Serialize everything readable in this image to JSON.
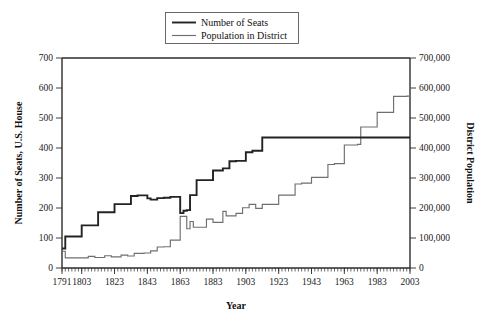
{
  "chart_data": {
    "type": "line",
    "title": "",
    "xlabel": "Year",
    "ylabel": "Number of Seats, U.S. House",
    "y2label": "District Population",
    "xlim": [
      1791,
      2003
    ],
    "ylim": [
      0,
      700
    ],
    "y2lim": [
      0,
      700000
    ],
    "grid": false,
    "legend_position": "top-center",
    "x_tick_labels": [
      "1791",
      "1803",
      "1823",
      "1843",
      "1863",
      "1883",
      "1903",
      "1923",
      "1943",
      "1963",
      "1983",
      "2003"
    ],
    "x_tick_values": [
      1791,
      1803,
      1823,
      1843,
      1863,
      1883,
      1903,
      1923,
      1943,
      1963,
      1983,
      2003
    ],
    "x_minor_tick_step": 2,
    "y_tick_labels": [
      "0",
      "100",
      "200",
      "300",
      "400",
      "500",
      "600",
      "700"
    ],
    "y_tick_values": [
      0,
      100,
      200,
      300,
      400,
      500,
      600,
      700
    ],
    "y2_tick_labels": [
      "0",
      "100,000",
      "200,000",
      "300,000",
      "400,000",
      "500,000",
      "600,000",
      "700,000"
    ],
    "y2_tick_values": [
      0,
      100000,
      200000,
      300000,
      400000,
      500000,
      600000,
      700000
    ],
    "series": [
      {
        "name": "Number of Seats",
        "axis": "left",
        "color": "#232323",
        "step": true,
        "x": [
          1791,
          1793,
          1803,
          1813,
          1823,
          1833,
          1843,
          1853,
          1863,
          1873,
          1883,
          1893,
          1903,
          1913,
          1923,
          1933,
          1943,
          1953,
          1963,
          1973,
          1983,
          1993,
          2003
        ],
        "values": [
          65,
          105,
          142,
          186,
          213,
          242,
          232,
          237,
          183,
          243,
          293,
          332,
          357,
          435,
          435,
          435,
          435,
          435,
          435,
          435,
          435,
          435,
          435
        ]
      },
      {
        "name": "Population in District",
        "axis": "right",
        "color": "#6f6f6f",
        "step": true,
        "x": [
          1791,
          1793,
          1803,
          1813,
          1823,
          1833,
          1843,
          1853,
          1863,
          1873,
          1883,
          1893,
          1903,
          1913,
          1923,
          1933,
          1943,
          1953,
          1963,
          1973,
          1983,
          1993,
          2003
        ],
        "values": [
          56000,
          34000,
          34000,
          35000,
          40000,
          48000,
          71000,
          93000,
          127000,
          131000,
          152000,
          174000,
          194000,
          212000,
          212000,
          280000,
          302000,
          345000,
          410000,
          470000,
          519000,
          572000,
          647000
        ]
      }
    ],
    "seats_detail": {
      "label": "Number of Seats",
      "points": [
        {
          "year": 1791,
          "value": 65
        },
        {
          "year": 1793,
          "value": 105
        },
        {
          "year": 1795,
          "value": 105
        },
        {
          "year": 1803,
          "value": 142
        },
        {
          "year": 1813,
          "value": 186
        },
        {
          "year": 1815,
          "value": 186
        },
        {
          "year": 1823,
          "value": 213
        },
        {
          "year": 1833,
          "value": 240
        },
        {
          "year": 1837,
          "value": 242
        },
        {
          "year": 1843,
          "value": 232
        },
        {
          "year": 1845,
          "value": 228
        },
        {
          "year": 1849,
          "value": 233
        },
        {
          "year": 1853,
          "value": 234
        },
        {
          "year": 1857,
          "value": 237
        },
        {
          "year": 1861,
          "value": 237
        },
        {
          "year": 1863,
          "value": 183
        },
        {
          "year": 1865,
          "value": 191
        },
        {
          "year": 1867,
          "value": 193
        },
        {
          "year": 1869,
          "value": 243
        },
        {
          "year": 1873,
          "value": 293
        },
        {
          "year": 1877,
          "value": 293
        },
        {
          "year": 1883,
          "value": 325
        },
        {
          "year": 1889,
          "value": 332
        },
        {
          "year": 1893,
          "value": 356
        },
        {
          "year": 1897,
          "value": 357
        },
        {
          "year": 1903,
          "value": 386
        },
        {
          "year": 1907,
          "value": 391
        },
        {
          "year": 1913,
          "value": 435
        },
        {
          "year": 2003,
          "value": 435
        }
      ]
    },
    "population_detail": {
      "label": "Population in District",
      "points": [
        {
          "year": 1791,
          "value": 56000
        },
        {
          "year": 1793,
          "value": 34000
        },
        {
          "year": 1803,
          "value": 34000
        },
        {
          "year": 1807,
          "value": 39000
        },
        {
          "year": 1811,
          "value": 35000
        },
        {
          "year": 1817,
          "value": 41000
        },
        {
          "year": 1821,
          "value": 37000
        },
        {
          "year": 1827,
          "value": 43000
        },
        {
          "year": 1831,
          "value": 40000
        },
        {
          "year": 1835,
          "value": 49000
        },
        {
          "year": 1841,
          "value": 50000
        },
        {
          "year": 1845,
          "value": 57000
        },
        {
          "year": 1849,
          "value": 70000
        },
        {
          "year": 1853,
          "value": 71000
        },
        {
          "year": 1857,
          "value": 93000
        },
        {
          "year": 1861,
          "value": 93000
        },
        {
          "year": 1863,
          "value": 172000
        },
        {
          "year": 1867,
          "value": 131000
        },
        {
          "year": 1869,
          "value": 155000
        },
        {
          "year": 1871,
          "value": 136000
        },
        {
          "year": 1877,
          "value": 136000
        },
        {
          "year": 1879,
          "value": 163000
        },
        {
          "year": 1883,
          "value": 152000
        },
        {
          "year": 1889,
          "value": 189000
        },
        {
          "year": 1891,
          "value": 174000
        },
        {
          "year": 1897,
          "value": 182000
        },
        {
          "year": 1901,
          "value": 201000
        },
        {
          "year": 1905,
          "value": 212000
        },
        {
          "year": 1909,
          "value": 199000
        },
        {
          "year": 1913,
          "value": 212000
        },
        {
          "year": 1921,
          "value": 212000
        },
        {
          "year": 1923,
          "value": 243000
        },
        {
          "year": 1933,
          "value": 280000
        },
        {
          "year": 1937,
          "value": 283000
        },
        {
          "year": 1943,
          "value": 302000
        },
        {
          "year": 1953,
          "value": 345000
        },
        {
          "year": 1957,
          "value": 348000
        },
        {
          "year": 1963,
          "value": 410000
        },
        {
          "year": 1971,
          "value": 412000
        },
        {
          "year": 1973,
          "value": 470000
        },
        {
          "year": 1983,
          "value": 519000
        },
        {
          "year": 1993,
          "value": 572000
        },
        {
          "year": 2001,
          "value": 573000
        },
        {
          "year": 2003,
          "value": 647000
        }
      ]
    }
  },
  "legend": {
    "items": [
      {
        "label": "Number of Seats",
        "color": "#232323",
        "weight": "thick"
      },
      {
        "label": "Population in District",
        "color": "#6f6f6f",
        "weight": "thin"
      }
    ]
  },
  "axes": {
    "left_title": "Number of Seats, U.S. House",
    "right_title": "District Population",
    "bottom_title": "Year"
  }
}
